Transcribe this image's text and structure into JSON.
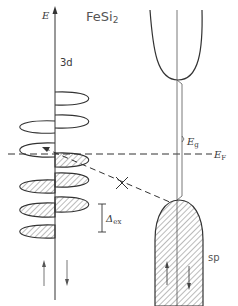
{
  "diagram": {
    "title": "FeSi",
    "title_subscript": "2",
    "axis_label": "E",
    "band_label_3d": "3d",
    "band_label_sp": "sp",
    "gap_label": "E",
    "gap_label_sub": "g",
    "fermi_label": "E",
    "fermi_label_sub": "F",
    "exchange_label": "Δ",
    "exchange_label_sub": "ex",
    "spin_up_symbol": "↑",
    "spin_down_symbol": "↓",
    "forbidden_transition_mark": "×",
    "colors": {
      "line": "#333333",
      "hatch": "#555555",
      "background": "#ffffff"
    },
    "d_states_spin_down": [
      {
        "y_top": 92,
        "y_bottom": 105,
        "filled": false
      },
      {
        "y_top": 115,
        "y_bottom": 128,
        "filled": false
      },
      {
        "y_top": 153,
        "y_bottom": 167,
        "filled": true
      },
      {
        "y_top": 173,
        "y_bottom": 187,
        "filled": true
      },
      {
        "y_top": 197,
        "y_bottom": 212,
        "filled": true
      }
    ],
    "d_states_spin_up": [
      {
        "y_top": 121,
        "y_bottom": 133,
        "filled": false
      },
      {
        "y_top": 143,
        "y_bottom": 157,
        "filled": false
      },
      {
        "y_top": 180,
        "y_bottom": 193,
        "filled": true
      },
      {
        "y_top": 203,
        "y_bottom": 217,
        "filled": true
      },
      {
        "y_top": 225,
        "y_bottom": 238,
        "filled": true
      }
    ]
  }
}
